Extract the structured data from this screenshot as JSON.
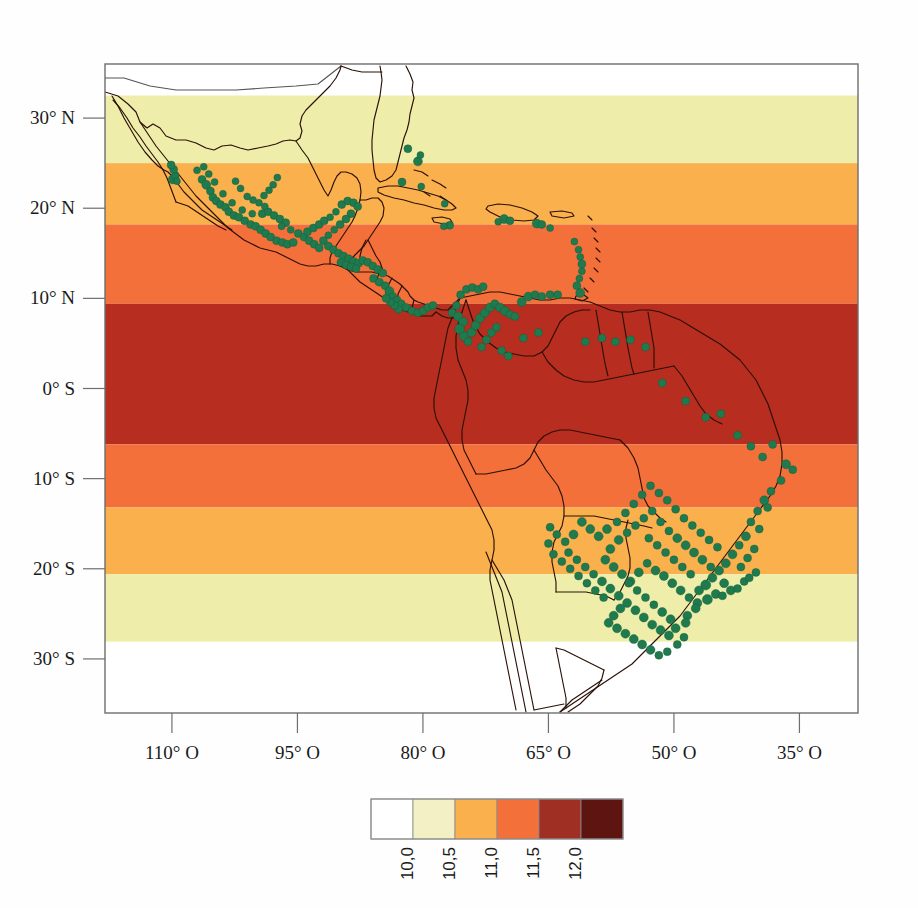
{
  "figure": {
    "type": "map",
    "background_color": "#fefefe"
  },
  "chart_data": {
    "type": "heatmap",
    "title": "",
    "xlabel": "",
    "ylabel": "",
    "projection": "equirectangular",
    "xlim": [
      -118,
      -28
    ],
    "ylim": [
      -36,
      36
    ],
    "grid": false,
    "x_ticks": [
      {
        "label": "110° O",
        "value": -110
      },
      {
        "label": "95° O",
        "value": -95
      },
      {
        "label": "80° O",
        "value": -80
      },
      {
        "label": "65° O",
        "value": -65
      },
      {
        "label": "50° O",
        "value": -50
      },
      {
        "label": "35° O",
        "value": -35
      }
    ],
    "y_ticks": [
      {
        "label": "30° N",
        "value": 30
      },
      {
        "label": "20° N",
        "value": 20
      },
      {
        "label": "10° N",
        "value": 10
      },
      {
        "label": "0° S",
        "value": 0
      },
      {
        "label": "10° S",
        "value": -10
      },
      {
        "label": "20° S",
        "value": -20
      },
      {
        "label": "30° S",
        "value": -30
      }
    ],
    "bands": [
      {
        "class": "10,0",
        "color": "#ffffff",
        "lat_top": 36.0,
        "lat_bottom": 32.5
      },
      {
        "class": "10,5",
        "color": "#eeeeaa",
        "lat_top": 32.5,
        "lat_bottom": 25.0
      },
      {
        "class": "11,0",
        "color": "#fbb04e",
        "lat_top": 25.0,
        "lat_bottom": 18.2
      },
      {
        "class": "11,5",
        "color": "#f4703a",
        "lat_top": 18.2,
        "lat_bottom": 9.4
      },
      {
        "class": "12,0",
        "color": "#b72d20",
        "lat_top": 9.4,
        "lat_bottom": -6.2
      },
      {
        "class": "11,5",
        "color": "#f4703a",
        "lat_top": -6.2,
        "lat_bottom": -13.2
      },
      {
        "class": "11,0",
        "color": "#fbb04e",
        "lat_top": -13.2,
        "lat_bottom": -20.6
      },
      {
        "class": "10,5",
        "color": "#eeeeaa",
        "lat_top": -20.6,
        "lat_bottom": -28.1
      },
      {
        "class": "10,0",
        "color": "#ffffff",
        "lat_top": -28.1,
        "lat_bottom": -36.0
      }
    ],
    "point_series": {
      "name": "occurrence-records",
      "color": "#1f7a4d",
      "marker": "circle",
      "count": 268
    }
  },
  "colorbar": {
    "name": "legend-colorbar",
    "cells": [
      {
        "color": "#ffffff"
      },
      {
        "color": "#f2f0c4"
      },
      {
        "color": "#fbb04e"
      },
      {
        "color": "#f4703a"
      },
      {
        "color": "#9e2f22"
      },
      {
        "color": "#5e1410"
      }
    ],
    "tick_labels": [
      "10,0",
      "10,5",
      "11,0",
      "11,5",
      "12,0"
    ],
    "orientation": "horizontal",
    "label_rotation": -90
  },
  "frame": {
    "border_color": "#6e6e6e",
    "tick_color": "#6e6e6e"
  }
}
